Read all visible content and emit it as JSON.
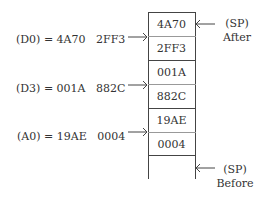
{
  "stack": {
    "cells": [
      "4A70",
      "2FF3",
      "001A",
      "882C",
      "19AE",
      "0004"
    ]
  },
  "registers": [
    {
      "label": "(D0) = 4A70   2FF3"
    },
    {
      "label": "(D3) = 001A   882C"
    },
    {
      "label": "(A0) = 19AE   0004"
    }
  ],
  "pointers": {
    "after": {
      "line1": "(SP)",
      "line2": "After"
    },
    "before": {
      "line1": "(SP)",
      "line2": "Before"
    }
  }
}
